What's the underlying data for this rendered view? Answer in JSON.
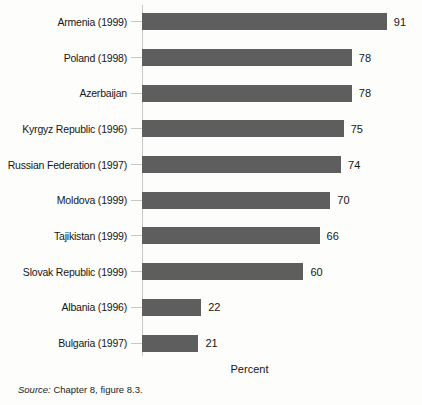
{
  "chart_data": {
    "type": "bar",
    "orientation": "horizontal",
    "categories": [
      "Armenia (1999)",
      "Poland (1998)",
      "Azerbaijan",
      "Kyrgyz Republic (1996)",
      "Russian Federation (1997)",
      "Moldova (1999)",
      "Tajikistan (1999)",
      "Slovak Republic (1999)",
      "Albania (1996)",
      "Bulgaria (1997)"
    ],
    "values": [
      91,
      78,
      78,
      75,
      74,
      70,
      66,
      60,
      22,
      21
    ],
    "xlabel": "Percent",
    "xlim": [
      0,
      100
    ],
    "bar_color": "#5e5e5e",
    "value_labels_shown": true,
    "grid": false,
    "legend": "none"
  },
  "footer": {
    "source_label": "Source:",
    "source_text": " Chapter 8, figure 8.3."
  }
}
